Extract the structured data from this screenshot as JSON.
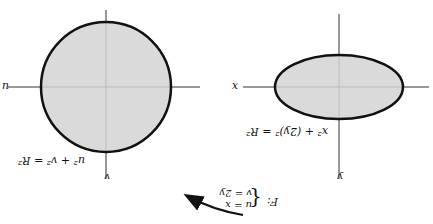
{
  "diagram": {
    "map": {
      "name": "F:",
      "eq1": "u = x",
      "eq2": "v = 2y"
    },
    "left": {
      "x_axis": "x",
      "y_axis": "y",
      "equation": "x² + (2y)² = R²",
      "shape": "ellipse"
    },
    "right": {
      "u_axis": "u",
      "v_axis": "v",
      "equation": "u² + v² = R²",
      "shape": "circle"
    },
    "colors": {
      "fill": "#d3d3d3",
      "stroke": "#111111"
    },
    "orientation": "rotated 180°"
  }
}
